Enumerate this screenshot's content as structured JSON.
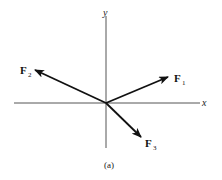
{
  "figure": {
    "caption": "(a)",
    "axes": {
      "x_label": "x",
      "y_label": "y"
    },
    "vectors": [
      {
        "name": "F",
        "subscript": "1",
        "direction": "up-right"
      },
      {
        "name": "F",
        "subscript": "2",
        "direction": "up-left"
      },
      {
        "name": "F",
        "subscript": "3",
        "direction": "down-right"
      }
    ],
    "colors": {
      "axis": "#555555",
      "vector": "#111111",
      "background": "#ffffff"
    }
  }
}
